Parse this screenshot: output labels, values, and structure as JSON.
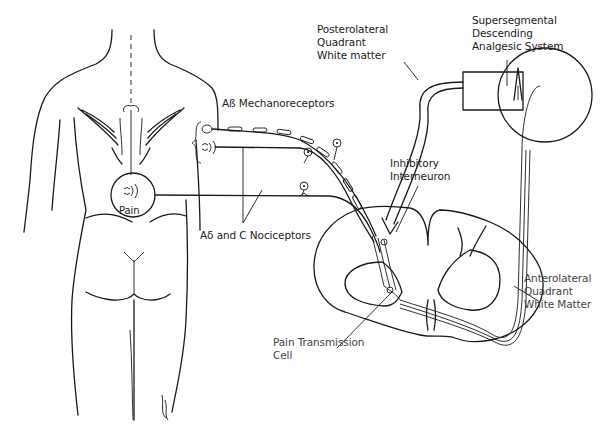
{
  "diagram": {
    "labels": {
      "supersegmental": [
        "Supersegmental",
        "Descending",
        "Analgesic System"
      ],
      "posterolateral": [
        "Posterolateral",
        "Quadrant",
        "White matter"
      ],
      "mechanoreceptors": "Aß Mechanoreceptors",
      "inhibitory": [
        "Inhibitory",
        "Interneuron"
      ],
      "nociceptors": "Aδ and C Nociceptors",
      "pain": "Pain",
      "transmission": [
        "Pain Transmission",
        "Cell"
      ],
      "anterolateral": [
        "Anterolateral",
        "Quadrant",
        "White Matter"
      ]
    },
    "colors": {
      "line": "#1a1a1a",
      "background": "#ffffff",
      "text": "#222222"
    }
  }
}
